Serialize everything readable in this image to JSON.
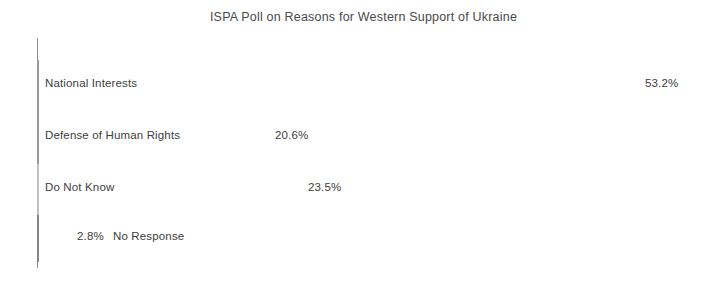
{
  "chart_data": {
    "type": "bar",
    "orientation": "horizontal",
    "title": "ISPA Poll on Reasons for Western Support of Ukraine",
    "xlabel": "",
    "ylabel": "",
    "categories": [
      "National Interests",
      "Defense of Human Rights",
      "Do Not Know",
      "No Response"
    ],
    "values": [
      53.2,
      20.6,
      23.5,
      2.8
    ],
    "value_labels": [
      "53.2%",
      "20.6%",
      "23.5%",
      "2.8%"
    ],
    "units": "percent",
    "xlim": [
      0,
      53.2
    ],
    "grid": false,
    "legend": false,
    "series": [
      {
        "name": "Share of respondents",
        "values": [
          53.2,
          20.6,
          23.5,
          2.8
        ]
      }
    ],
    "bar_styles": [
      "open",
      "open",
      "light",
      "dark"
    ],
    "colors": {
      "bar_open_fill": "#ffffff",
      "bar_open_border": "#9a9a9a",
      "bar_light_fill": "#cfcfcf",
      "bar_dark_fill": "#8d8d8d",
      "axis": "#8e8e8e",
      "text": "#3d3d3d",
      "background": "#ffffff"
    }
  }
}
